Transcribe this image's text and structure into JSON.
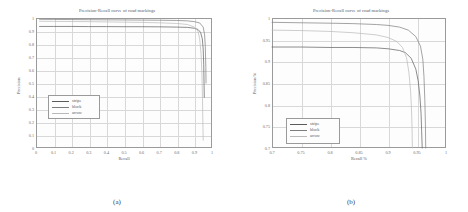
{
  "figure": {
    "panels": [
      {
        "caption": "(a)",
        "title": "Precision-Recall curve of road markings",
        "xlabel": "Recall",
        "ylabel": "Precision",
        "xticks": [
          "0",
          "0.1",
          "0.2",
          "0.3",
          "0.4",
          "0.5",
          "0.6",
          "0.7",
          "0.8",
          "0.9",
          "1"
        ],
        "yticks": [
          "0",
          "0.1",
          "0.2",
          "0.3",
          "0.4",
          "0.5",
          "0.6",
          "0.7",
          "0.8",
          "0.9",
          "1"
        ],
        "legend": [
          "stripe",
          "block",
          "arrow"
        ]
      },
      {
        "caption": "(b)",
        "title": "Precision-Recall curve of road markings",
        "xlabel": "Recall %",
        "ylabel": "Precision %",
        "xticks": [
          "0.7",
          "0.75",
          "0.8",
          "0.85",
          "0.9",
          "0.95",
          "1"
        ],
        "yticks": [
          "0.7",
          "0.75",
          "0.8",
          "0.85",
          "0.9",
          "0.95",
          "1"
        ],
        "legend": [
          "stripe",
          "block",
          "arrow"
        ]
      }
    ]
  },
  "colors": {
    "stripe": "#5b5b5b",
    "block": "#7d7d7d",
    "arrow": "#b9b9b9",
    "axis": "#9a9a9a",
    "grid": "#d8d8d8"
  },
  "chart_data": [
    {
      "type": "line",
      "title": "Precision-Recall curve of road markings",
      "xlabel": "Recall",
      "ylabel": "Precision",
      "xlim": [
        0,
        1
      ],
      "ylim": [
        0,
        1
      ],
      "grid": true,
      "legend_position": "center-left",
      "series": [
        {
          "name": "stripe",
          "x": [
            0.02,
            0.1,
            0.2,
            0.3,
            0.4,
            0.5,
            0.6,
            0.7,
            0.8,
            0.86,
            0.9,
            0.92,
            0.935,
            0.945,
            0.95,
            0.953,
            0.955,
            0.956
          ],
          "y": [
            0.935,
            0.935,
            0.935,
            0.934,
            0.934,
            0.933,
            0.933,
            0.932,
            0.93,
            0.928,
            0.921,
            0.912,
            0.89,
            0.84,
            0.76,
            0.64,
            0.48,
            0.39
          ]
        },
        {
          "name": "block",
          "x": [
            0.02,
            0.1,
            0.2,
            0.3,
            0.4,
            0.5,
            0.6,
            0.7,
            0.8,
            0.86,
            0.9,
            0.93,
            0.95,
            0.958,
            0.962,
            0.965,
            0.966
          ],
          "y": [
            0.99,
            0.989,
            0.988,
            0.987,
            0.986,
            0.985,
            0.984,
            0.983,
            0.981,
            0.978,
            0.972,
            0.962,
            0.93,
            0.87,
            0.78,
            0.62,
            0.5
          ]
        },
        {
          "name": "arrow",
          "x": [
            0.02,
            0.1,
            0.2,
            0.3,
            0.4,
            0.5,
            0.6,
            0.7,
            0.8,
            0.86,
            0.9,
            0.92,
            0.93,
            0.938,
            0.943,
            0.946,
            0.948,
            0.95
          ],
          "y": [
            0.975,
            0.974,
            0.973,
            0.972,
            0.97,
            0.968,
            0.966,
            0.963,
            0.958,
            0.95,
            0.93,
            0.9,
            0.84,
            0.72,
            0.56,
            0.38,
            0.2,
            0.06
          ]
        }
      ]
    },
    {
      "type": "line",
      "title": "Precision-Recall curve of road markings",
      "xlabel": "Recall %",
      "ylabel": "Precision %",
      "xlim": [
        0.7,
        1
      ],
      "ylim": [
        0.7,
        1
      ],
      "grid": true,
      "legend_position": "lower-left",
      "series": [
        {
          "name": "stripe",
          "x": [
            0.7,
            0.75,
            0.8,
            0.84,
            0.88,
            0.9,
            0.92,
            0.93,
            0.94,
            0.948,
            0.952,
            0.955,
            0.957,
            0.958,
            0.959
          ],
          "y": [
            0.933,
            0.933,
            0.932,
            0.932,
            0.931,
            0.929,
            0.925,
            0.92,
            0.907,
            0.882,
            0.855,
            0.82,
            0.78,
            0.74,
            0.7
          ]
        },
        {
          "name": "block",
          "x": [
            0.7,
            0.75,
            0.8,
            0.84,
            0.88,
            0.9,
            0.92,
            0.935,
            0.948,
            0.956,
            0.96,
            0.962,
            0.9635,
            0.9645,
            0.965
          ],
          "y": [
            0.99,
            0.989,
            0.988,
            0.987,
            0.985,
            0.983,
            0.979,
            0.972,
            0.957,
            0.935,
            0.905,
            0.865,
            0.81,
            0.755,
            0.7
          ]
        },
        {
          "name": "arrow",
          "x": [
            0.7,
            0.75,
            0.8,
            0.84,
            0.88,
            0.9,
            0.915,
            0.925,
            0.932,
            0.936,
            0.939,
            0.9405,
            0.9415,
            0.942
          ],
          "y": [
            0.972,
            0.971,
            0.969,
            0.966,
            0.961,
            0.955,
            0.946,
            0.932,
            0.908,
            0.875,
            0.83,
            0.79,
            0.745,
            0.7
          ]
        }
      ]
    }
  ]
}
